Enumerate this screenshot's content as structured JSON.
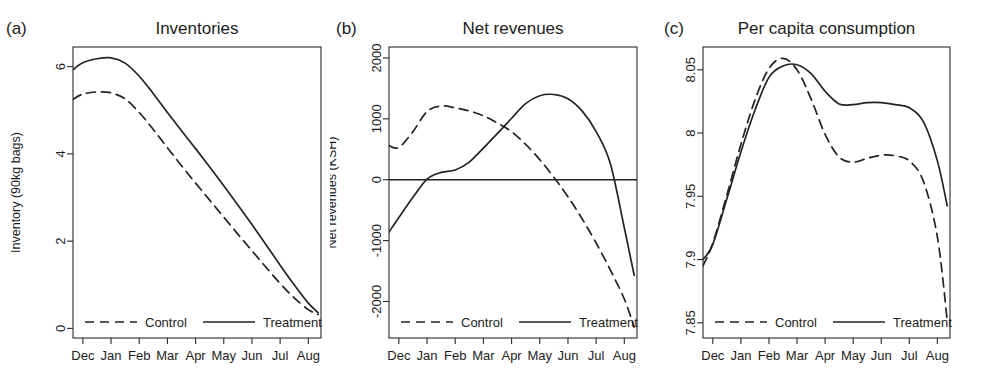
{
  "figure": {
    "background": "#ffffff",
    "line_color": "#232323",
    "width": 987,
    "height": 390
  },
  "legend": {
    "control_label": "Control",
    "treatment_label": "Treatment",
    "control_style": "dashed",
    "treatment_style": "solid"
  },
  "panels": [
    {
      "tag": "(a)",
      "title": "Inventories"
    },
    {
      "tag": "(b)",
      "title": "Net revenues"
    },
    {
      "tag": "(c)",
      "title": "Per capita consumption"
    }
  ],
  "chart_data": [
    {
      "type": "line",
      "panel": "(a)",
      "title": "Inventories",
      "xlabel": "",
      "ylabel": "Inventory (90kg bags)",
      "x": [
        "Dec",
        "Jan",
        "Feb",
        "Mar",
        "Apr",
        "May",
        "Jun",
        "Jul",
        "Aug"
      ],
      "xticklabels": [
        "Dec",
        "Jan",
        "Feb",
        "Mar",
        "Apr",
        "May",
        "Jun",
        "Jul",
        "Aug"
      ],
      "yticks": [
        0,
        2,
        4,
        6
      ],
      "yticklabels": [
        "0",
        "2",
        "4",
        "6"
      ],
      "ylim": [
        -0.22,
        6.45
      ],
      "xlim": [
        -0.35,
        8.45
      ],
      "grid": false,
      "legend_position": "bottom",
      "series": [
        {
          "name": "Treatment",
          "style": "solid",
          "x": [
            -0.35,
            0.0,
            0.5,
            1.0,
            1.5,
            2.0,
            2.5,
            3.0,
            3.5,
            4.0,
            4.5,
            5.0,
            5.5,
            6.0,
            6.5,
            7.0,
            7.5,
            8.0,
            8.35
          ],
          "values": [
            5.93,
            6.09,
            6.18,
            6.2,
            6.08,
            5.78,
            5.38,
            4.95,
            4.53,
            4.12,
            3.7,
            3.27,
            2.83,
            2.38,
            1.92,
            1.45,
            1.0,
            0.58,
            0.36
          ]
        },
        {
          "name": "Control",
          "style": "dashed",
          "x": [
            -0.35,
            0.0,
            0.5,
            1.0,
            1.5,
            2.0,
            2.5,
            3.0,
            3.5,
            4.0,
            4.5,
            5.0,
            5.5,
            6.0,
            6.5,
            7.0,
            7.5,
            8.0,
            8.35
          ],
          "values": [
            5.25,
            5.37,
            5.42,
            5.4,
            5.26,
            4.95,
            4.56,
            4.14,
            3.73,
            3.33,
            2.94,
            2.55,
            2.16,
            1.78,
            1.4,
            1.03,
            0.7,
            0.43,
            0.32
          ]
        }
      ]
    },
    {
      "type": "line",
      "panel": "(b)",
      "title": "Net revenues",
      "xlabel": "",
      "ylabel": "Net revenues (KSH)",
      "x": [
        "Dec",
        "Jan",
        "Feb",
        "Mar",
        "Apr",
        "May",
        "Jun",
        "Jul",
        "Aug"
      ],
      "xticklabels": [
        "Dec",
        "Jan",
        "Feb",
        "Mar",
        "Apr",
        "May",
        "Jun",
        "Jul",
        "Aug"
      ],
      "yticks": [
        -2000,
        -1000,
        0,
        1000,
        2000
      ],
      "yticklabels": [
        "-2000",
        "-1000",
        "0",
        "1000",
        "2000"
      ],
      "ylim": [
        -2600,
        2180
      ],
      "xlim": [
        -0.35,
        8.45
      ],
      "grid": false,
      "zero_line": 0,
      "legend_position": "bottom",
      "series": [
        {
          "name": "Treatment",
          "style": "solid",
          "x": [
            -0.35,
            0.0,
            0.5,
            1.0,
            1.5,
            2.0,
            2.5,
            3.0,
            3.5,
            4.0,
            4.5,
            5.0,
            5.5,
            6.0,
            6.5,
            7.0,
            7.5,
            8.0,
            8.35
          ],
          "values": [
            -860,
            -620,
            -290,
            10,
            120,
            160,
            290,
            520,
            760,
            1010,
            1250,
            1380,
            1400,
            1330,
            1130,
            790,
            270,
            -790,
            -1570
          ]
        },
        {
          "name": "Control",
          "style": "dashed",
          "x": [
            -0.35,
            0.0,
            0.5,
            1.0,
            1.5,
            2.0,
            2.5,
            3.0,
            3.5,
            4.0,
            4.5,
            5.0,
            5.5,
            6.0,
            6.5,
            7.0,
            7.5,
            8.0,
            8.35
          ],
          "values": [
            560,
            530,
            790,
            1120,
            1210,
            1180,
            1130,
            1050,
            930,
            790,
            580,
            330,
            40,
            -280,
            -640,
            -1040,
            -1480,
            -1960,
            -2420
          ]
        }
      ]
    },
    {
      "type": "line",
      "panel": "(c)",
      "title": "Per capita consumption",
      "xlabel": "",
      "ylabel": "Per cap cons. (log)",
      "x": [
        "Dec",
        "Jan",
        "Feb",
        "Mar",
        "Apr",
        "May",
        "Jun",
        "Jul",
        "Aug"
      ],
      "xticklabels": [
        "Dec",
        "Jan",
        "Feb",
        "Mar",
        "Apr",
        "May",
        "Jun",
        "Jul",
        "Aug"
      ],
      "yticks": [
        7.85,
        7.9,
        7.95,
        8,
        8.05
      ],
      "yticklabels": [
        "7.85",
        "7.9",
        "7.95",
        "8",
        "8.05"
      ],
      "ylim": [
        7.838,
        8.068
      ],
      "xlim": [
        -0.35,
        8.45
      ],
      "grid": false,
      "legend_position": "bottom",
      "series": [
        {
          "name": "Treatment",
          "style": "solid",
          "x": [
            -0.35,
            0.0,
            0.5,
            1.0,
            1.5,
            2.0,
            2.5,
            3.0,
            3.5,
            4.0,
            4.5,
            5.0,
            5.5,
            6.0,
            6.5,
            7.0,
            7.5,
            8.0,
            8.35
          ],
          "values": [
            7.9,
            7.912,
            7.948,
            7.985,
            8.018,
            8.044,
            8.053,
            8.054,
            8.047,
            8.033,
            8.023,
            8.0225,
            8.024,
            8.024,
            8.0225,
            8.02,
            8.009,
            7.978,
            7.9425
          ]
        },
        {
          "name": "Control",
          "style": "dashed",
          "x": [
            -0.35,
            0.0,
            0.5,
            1.0,
            1.5,
            2.0,
            2.5,
            3.0,
            3.5,
            4.0,
            4.5,
            5.0,
            5.5,
            6.0,
            6.5,
            7.0,
            7.5,
            8.0,
            8.35
          ],
          "values": [
            7.895,
            7.913,
            7.951,
            7.991,
            8.026,
            8.051,
            8.059,
            8.05,
            8.027,
            7.999,
            7.981,
            7.977,
            7.98,
            7.9825,
            7.982,
            7.978,
            7.962,
            7.918,
            7.852
          ]
        }
      ]
    }
  ]
}
